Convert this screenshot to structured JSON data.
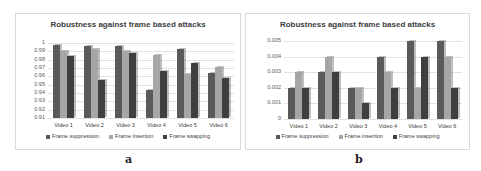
{
  "figure": {
    "sub_labels": [
      "a",
      "b"
    ]
  },
  "chart_data": [
    {
      "type": "bar",
      "title": "Robustness against frame based attacks",
      "xlabel": "",
      "ylabel": "",
      "categories": [
        "Video 1",
        "Video 2",
        "Video 3",
        "Video 4",
        "Video 5",
        "Video 6"
      ],
      "series": [
        {
          "name": "Frame suppression",
          "color": "#5a5a5a",
          "values": [
            0.998,
            0.996,
            0.996,
            0.944,
            0.993,
            0.964
          ]
        },
        {
          "name": "Frame insertion",
          "color": "#a6a6a6",
          "values": [
            0.99,
            0.993,
            0.991,
            0.986,
            0.963,
            0.971
          ]
        },
        {
          "name": "Frame swapping",
          "color": "#3f3f3f",
          "values": [
            0.985,
            0.956,
            0.988,
            0.966,
            0.976,
            0.958
          ]
        }
      ],
      "yticks": [
        "1",
        "0.99",
        "0.98",
        "0.97",
        "0.96",
        "0.95",
        "0.94",
        "0.93",
        "0.92",
        "0.91"
      ],
      "ylim": [
        0.91,
        1.0
      ],
      "grid": true,
      "legend_position": "bottom",
      "sub_label": "a"
    },
    {
      "type": "bar",
      "title": "Robustness against frame based attacks",
      "xlabel": "",
      "ylabel": "",
      "categories": [
        "Video 1",
        "Video 2",
        "Video 3",
        "Video 4",
        "Video 5",
        "Video 6"
      ],
      "series": [
        {
          "name": "Frame suppression",
          "color": "#5a5a5a",
          "values": [
            0.002,
            0.003,
            0.002,
            0.004,
            0.005,
            0.005
          ]
        },
        {
          "name": "Frame insertion",
          "color": "#a6a6a6",
          "values": [
            0.003,
            0.004,
            0.002,
            0.003,
            0.002,
            0.004
          ]
        },
        {
          "name": "Frame swapping",
          "color": "#3f3f3f",
          "values": [
            0.002,
            0.003,
            0.001,
            0.002,
            0.004,
            0.002
          ]
        }
      ],
      "yticks": [
        "0.005",
        "0.004",
        "0.003",
        "0.002",
        "0.001",
        "0"
      ],
      "ylim": [
        0,
        0.005
      ],
      "grid": true,
      "legend_position": "bottom",
      "sub_label": "b"
    }
  ]
}
